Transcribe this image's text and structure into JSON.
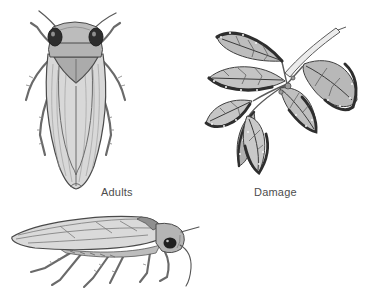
{
  "canvas": {
    "width": 370,
    "height": 308,
    "background": "#ffffff"
  },
  "labels": {
    "adults": "Adults",
    "damage": "Damage"
  },
  "illustrations": [
    {
      "name": "leafhopper-dorsal-illustration",
      "description": "adult leafhopper, top (dorsal) view"
    },
    {
      "name": "damaged-leaves-illustration",
      "description": "twig with curled, stippled leafhopper-damaged leaves"
    },
    {
      "name": "leafhopper-side-illustration",
      "description": "adult leafhopper, side (lateral) view"
    }
  ],
  "colors": {
    "ink_outline": "#4a4a4a",
    "label_text": "#4d4d4d",
    "wing_fill_light": "#d8d8d8",
    "body_fill_mid": "#b5b5b5",
    "pronotum_dark": "#8f8f8f",
    "eye": "#1f1f1f",
    "leaf_fill": "#bdbdbd",
    "leaf_damage_edge": "#2e2e2e",
    "damage_spot": "#f2f2f2",
    "background": "#ffffff"
  }
}
